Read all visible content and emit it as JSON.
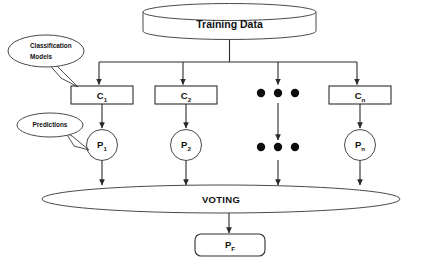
{
  "diagram": {
    "title_node": {
      "label": "Training Data",
      "shape": "cylinder"
    },
    "callouts": [
      {
        "name": "classification-models",
        "line1": "Classification",
        "line2": "Models"
      },
      {
        "name": "predictions",
        "line1": "Predictions",
        "line2": ""
      }
    ],
    "classifiers": [
      {
        "base": "C",
        "sub": "1"
      },
      {
        "base": "C",
        "sub": "2"
      },
      {
        "base": "C",
        "sub": "n"
      }
    ],
    "predictions": [
      {
        "base": "P",
        "sub": "1"
      },
      {
        "base": "P",
        "sub": "2"
      },
      {
        "base": "P",
        "sub": "n"
      }
    ],
    "ellipsis_label": "• • •",
    "voting_node": {
      "label": "VOTING",
      "shape": "ellipse"
    },
    "final_node": {
      "base": "P",
      "sub": "F",
      "shape": "rounded-rect"
    },
    "colors": {
      "stroke": "#2f2f2f",
      "text": "#111111",
      "background": "#ffffff",
      "dot": "#0d0d0d"
    }
  }
}
